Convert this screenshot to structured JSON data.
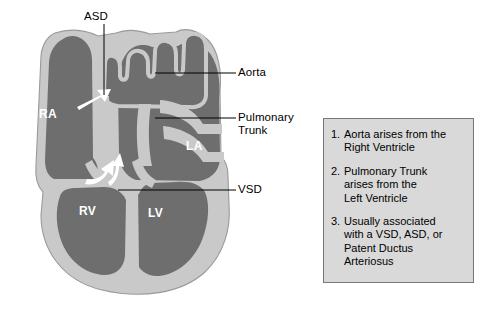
{
  "figure": {
    "colors": {
      "background": "#ffffff",
      "chamber_blood": "#6e6e6e",
      "myocardium_wall": "#c9c9c9",
      "wall_outline": "#8a8a8a",
      "flow_arrow": "#ffffff",
      "leader_line": "#000000",
      "text": "#000000",
      "chamber_label_text": "#ffffff",
      "info_box_fill": "#d9d9d9",
      "info_box_border": "#777777"
    }
  },
  "callouts": {
    "asd": "ASD",
    "aorta": "Aorta",
    "pulmonary_trunk": "Pulmonary\nTrunk",
    "vsd": "VSD"
  },
  "chambers": {
    "ra": "RA",
    "la": "LA",
    "rv": "RV",
    "lv": "LV"
  },
  "info_box": {
    "items": [
      {
        "number": "1.",
        "text": "Aorta arises from the\nRight Ventricle"
      },
      {
        "number": "2.",
        "text": "Pulmonary Trunk\narises from the\nLeft Ventricle"
      },
      {
        "number": "3.",
        "text": "Usually associated\nwith a VSD, ASD, or\nPatent Ductus\nArteriosus"
      }
    ]
  }
}
